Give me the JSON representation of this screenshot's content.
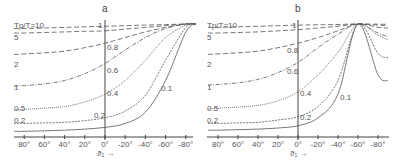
{
  "chart_data": [
    {
      "type": "line",
      "panel": "a",
      "title": "a",
      "xlabel": "ϑ₁ →",
      "ylabel": "",
      "xticks": [
        "80°",
        "60°",
        "40°",
        "20°",
        "0°",
        "-20°",
        "-40°",
        "-60°",
        "-80°"
      ],
      "yticks": [
        "1",
        "0.8",
        "0.6",
        "0.4",
        "0.2"
      ],
      "xlim": [
        90,
        -90
      ],
      "ylim": [
        0,
        1
      ],
      "x": [
        90,
        80,
        60,
        40,
        20,
        0,
        -20,
        -40,
        -60,
        -80,
        -90
      ],
      "series": [
        {
          "name": "Tp/T=10",
          "style": "dashed",
          "values": [
            0.96,
            0.96,
            0.965,
            0.97,
            0.975,
            0.98,
            0.985,
            0.99,
            0.995,
            1.0,
            1.0
          ]
        },
        {
          "name": "5",
          "style": "dashed",
          "values": [
            0.92,
            0.92,
            0.925,
            0.93,
            0.935,
            0.94,
            0.955,
            0.97,
            0.985,
            1.0,
            1.0
          ]
        },
        {
          "name": "2",
          "style": "dashed",
          "values": [
            0.73,
            0.735,
            0.745,
            0.76,
            0.79,
            0.83,
            0.88,
            0.93,
            0.97,
            1.0,
            1.0
          ]
        },
        {
          "name": "1",
          "style": "dash-dot",
          "values": [
            0.45,
            0.455,
            0.47,
            0.5,
            0.56,
            0.65,
            0.77,
            0.88,
            0.96,
            1.0,
            1.0
          ]
        },
        {
          "name": "0.5",
          "style": "dotted",
          "values": [
            0.24,
            0.245,
            0.255,
            0.27,
            0.31,
            0.38,
            0.5,
            0.68,
            0.88,
            0.99,
            1.0
          ]
        },
        {
          "name": "0.2",
          "style": "dashed-fine",
          "values": [
            0.12,
            0.12,
            0.125,
            0.13,
            0.145,
            0.17,
            0.23,
            0.37,
            0.68,
            0.97,
            1.0
          ]
        },
        {
          "name": "0.1",
          "style": "solid",
          "values": [
            0.05,
            0.05,
            0.055,
            0.06,
            0.07,
            0.085,
            0.12,
            0.22,
            0.5,
            0.93,
            1.0
          ]
        }
      ],
      "curve_labels": [
        "Tp/T=10",
        "5",
        "2",
        "1",
        "0.5",
        "0.2",
        "0.2",
        "0.1"
      ]
    },
    {
      "type": "line",
      "panel": "b",
      "title": "b",
      "xlabel": "ϑ₁ →",
      "ylabel": "",
      "xticks": [
        "80°",
        "60°",
        "40°",
        "20°",
        "0°",
        "-20°",
        "-40°",
        "-60°",
        "-80°"
      ],
      "yticks": [
        "1",
        "0.8",
        "0.6",
        "0.4",
        "0.2"
      ],
      "xlim": [
        90,
        -90
      ],
      "ylim": [
        0,
        1
      ],
      "x": [
        90,
        80,
        60,
        40,
        20,
        0,
        -20,
        -40,
        -60,
        -80,
        -90
      ],
      "series": [
        {
          "name": "Tp/T=10",
          "style": "dashed",
          "values": [
            0.97,
            0.97,
            0.975,
            0.98,
            0.985,
            0.99,
            0.993,
            0.996,
            1.0,
            0.998,
            0.997
          ]
        },
        {
          "name": "5",
          "style": "dashed",
          "values": [
            0.92,
            0.92,
            0.925,
            0.93,
            0.94,
            0.95,
            0.965,
            0.98,
            1.0,
            0.99,
            0.985
          ]
        },
        {
          "name": "2",
          "style": "dashed",
          "values": [
            0.73,
            0.735,
            0.745,
            0.76,
            0.79,
            0.83,
            0.88,
            0.94,
            1.0,
            0.97,
            0.965
          ]
        },
        {
          "name": "1",
          "style": "dash-dot",
          "values": [
            0.46,
            0.465,
            0.48,
            0.51,
            0.57,
            0.66,
            0.79,
            0.91,
            1.0,
            0.92,
            0.89
          ]
        },
        {
          "name": "0.5",
          "style": "dotted",
          "values": [
            0.25,
            0.255,
            0.265,
            0.28,
            0.32,
            0.4,
            0.55,
            0.75,
            1.0,
            0.9,
            0.86
          ]
        },
        {
          "name": "0.2",
          "style": "dashed-fine",
          "values": [
            0.12,
            0.12,
            0.125,
            0.13,
            0.15,
            0.18,
            0.27,
            0.5,
            1.0,
            0.74,
            0.7
          ]
        },
        {
          "name": "0.1",
          "style": "solid",
          "values": [
            0.06,
            0.06,
            0.065,
            0.07,
            0.08,
            0.1,
            0.17,
            0.38,
            1.0,
            0.55,
            0.5
          ]
        }
      ],
      "curve_labels": [
        "Tp/T=10",
        "5",
        "2",
        "1",
        "0.5",
        "0.2",
        "0.2",
        "0.1"
      ]
    }
  ],
  "panels": [
    {
      "title": "a",
      "legend_title": "Tp/T=10",
      "left_labels": [
        "5",
        "2",
        "1",
        "0.5",
        "0.2"
      ],
      "axis_labels": [
        "1",
        "0.8",
        "0.6",
        "0.4",
        "0.2"
      ],
      "inner_labels": [
        "0.1"
      ],
      "xticks": [
        "80°",
        "60°",
        "40°",
        "20°",
        "0°",
        "-20°",
        "-40°",
        "-60°",
        "-80°"
      ],
      "xlabel": "ϑ₁ →"
    },
    {
      "title": "b",
      "legend_title": "Tp/T=10",
      "left_labels": [
        "5",
        "2",
        "1",
        "0.5",
        "0.2"
      ],
      "axis_labels": [
        "1",
        "0.8",
        "0.6",
        "0.4",
        "0.2"
      ],
      "inner_labels": [
        "0.1"
      ],
      "xticks": [
        "80°",
        "60°",
        "40°",
        "20°",
        "0°",
        "-20°",
        "-40°",
        "-60°",
        "-80°"
      ],
      "xlabel": "ϑ₁ →"
    }
  ]
}
